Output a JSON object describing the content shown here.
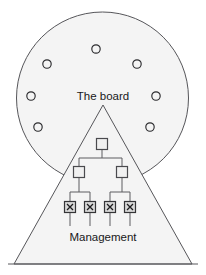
{
  "diagram": {
    "type": "venn-overlap-org-chart",
    "canvas": {
      "width": 206,
      "height": 275
    },
    "background_color": "#ffffff",
    "shape_fill_color": "#f4f4f4",
    "shape_stroke_color": "#56565a",
    "circle": {
      "label": "The board",
      "label_x": 103,
      "label_y": 97,
      "cx": 102.5,
      "cy": 98,
      "r": 86
    },
    "triangle": {
      "label": "Management",
      "label_x": 103,
      "label_y": 238,
      "apex_x": 103,
      "apex_y": 105,
      "base_left_x": 14,
      "base_right_x": 192,
      "base_y": 264
    },
    "baseline": {
      "x1": 8,
      "x2": 198,
      "y": 264
    },
    "board_members": [
      {
        "id": "member-1",
        "cx": 96,
        "cy": 49,
        "r": 4.2
      },
      {
        "id": "member-2",
        "cx": 47,
        "cy": 64,
        "r": 4.2
      },
      {
        "id": "member-3",
        "cx": 137,
        "cy": 64,
        "r": 4.2
      },
      {
        "id": "member-4",
        "cx": 31,
        "cy": 96,
        "r": 4.2
      },
      {
        "id": "member-5",
        "cx": 156,
        "cy": 96,
        "r": 4.2
      },
      {
        "id": "member-6",
        "cx": 38,
        "cy": 127,
        "r": 4.2
      },
      {
        "id": "member-7",
        "cx": 150,
        "cy": 127,
        "r": 4.2
      }
    ],
    "org_chart": {
      "root": {
        "id": "node-root",
        "cx": 102,
        "cy": 144,
        "size": 11
      },
      "middle": [
        {
          "id": "node-mid-left",
          "cx": 79,
          "cy": 172,
          "size": 11
        },
        {
          "id": "node-mid-right",
          "cx": 122,
          "cy": 172,
          "size": 11
        }
      ],
      "leaves": [
        {
          "id": "node-leaf-1",
          "cx": 70,
          "cy": 207,
          "size": 11,
          "mark": "x"
        },
        {
          "id": "node-leaf-2",
          "cx": 90,
          "cy": 207,
          "size": 11,
          "mark": "x"
        },
        {
          "id": "node-leaf-3",
          "cx": 110,
          "cy": 207,
          "size": 11,
          "mark": "x"
        },
        {
          "id": "node-leaf-4",
          "cx": 130,
          "cy": 207,
          "size": 11,
          "mark": "x"
        }
      ],
      "leaf_tail_bottom_y": 226,
      "root_bus_y": 158,
      "leaf_bus_left_y": 192,
      "leaf_bus_right_y": 192
    }
  }
}
